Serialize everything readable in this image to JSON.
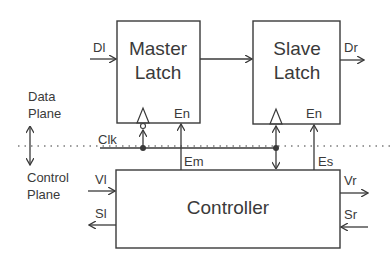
{
  "diagram": {
    "blocks": {
      "master": {
        "line1": "Master",
        "line2": "Latch",
        "en_label": "En"
      },
      "slave": {
        "line1": "Slave",
        "line2": "Latch",
        "en_label": "En"
      },
      "controller": {
        "label": "Controller"
      }
    },
    "signals": {
      "data_in": "Dl",
      "data_out": "Dr",
      "clock": "Clk",
      "enable_master": "Em",
      "enable_slave": "Es",
      "valid_left": "Vl",
      "valid_right": "Vr",
      "stall_left": "Sl",
      "stall_right": "Sr"
    },
    "planes": {
      "data_line1": "Data",
      "data_line2": "Plane",
      "control_line1": "Control",
      "control_line2": "Plane"
    },
    "colors": {
      "stroke": "#3a3a3a",
      "background": "#ffffff"
    }
  }
}
